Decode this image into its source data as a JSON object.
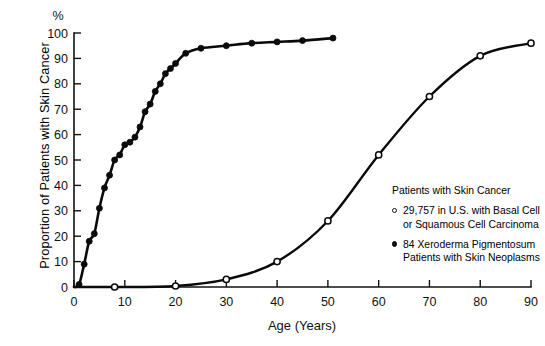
{
  "chart_data": {
    "type": "line",
    "title": "",
    "xlabel": "Age (Years)",
    "ylabel": "Proportion of Patients with Skin Cancer",
    "unit_label": "%",
    "xlim": [
      0,
      90
    ],
    "ylim": [
      0,
      100
    ],
    "xticks": [
      0,
      10,
      20,
      30,
      40,
      50,
      60,
      70,
      80,
      90
    ],
    "xtick_labels": [
      "0",
      "10",
      "20",
      "30",
      "40",
      "50",
      "60",
      "70",
      "80",
      "90"
    ],
    "yticks": [
      0,
      10,
      20,
      30,
      40,
      50,
      60,
      70,
      80,
      90,
      100
    ],
    "ytick_labels": [
      "0",
      "10",
      "20",
      "30",
      "40",
      "50",
      "60",
      "70",
      "80",
      "90",
      "100"
    ],
    "grid": false,
    "legend_position": "center-right",
    "legend_title": "Patients with Skin Cancer",
    "series": [
      {
        "name": "29,757 in U.S. with Basal Cell or Squamous Cell Carcinoma",
        "marker": "open-circle",
        "points": [
          {
            "x": 8,
            "y": 0
          },
          {
            "x": 20,
            "y": 0.4
          },
          {
            "x": 30,
            "y": 3
          },
          {
            "x": 40,
            "y": 10
          },
          {
            "x": 50,
            "y": 26
          },
          {
            "x": 60,
            "y": 52
          },
          {
            "x": 70,
            "y": 75
          },
          {
            "x": 80,
            "y": 91
          },
          {
            "x": 90,
            "y": 96
          }
        ]
      },
      {
        "name": "84 Xeroderma Pigmentosum Patients with Skin Neoplasms",
        "marker": "filled-circle",
        "points": [
          {
            "x": 1,
            "y": 1
          },
          {
            "x": 2,
            "y": 9
          },
          {
            "x": 3,
            "y": 18
          },
          {
            "x": 4,
            "y": 21
          },
          {
            "x": 5,
            "y": 31
          },
          {
            "x": 6,
            "y": 39
          },
          {
            "x": 7,
            "y": 44
          },
          {
            "x": 8,
            "y": 50
          },
          {
            "x": 9,
            "y": 52
          },
          {
            "x": 10,
            "y": 56
          },
          {
            "x": 11,
            "y": 57
          },
          {
            "x": 12,
            "y": 59
          },
          {
            "x": 13,
            "y": 63
          },
          {
            "x": 14,
            "y": 69
          },
          {
            "x": 15,
            "y": 72
          },
          {
            "x": 16,
            "y": 77
          },
          {
            "x": 17,
            "y": 80
          },
          {
            "x": 18,
            "y": 84
          },
          {
            "x": 19,
            "y": 86
          },
          {
            "x": 20,
            "y": 88
          },
          {
            "x": 22,
            "y": 92
          },
          {
            "x": 25,
            "y": 94
          },
          {
            "x": 30,
            "y": 95
          },
          {
            "x": 35,
            "y": 96
          },
          {
            "x": 40,
            "y": 96.5
          },
          {
            "x": 45,
            "y": 97
          },
          {
            "x": 51,
            "y": 98
          }
        ]
      }
    ]
  },
  "legend": {
    "title": "Patients with Skin Cancer",
    "entries": [
      {
        "marker": "open-circle",
        "line1": "29,757 in U.S. with Basal Cell",
        "line2": "or Squamous Cell Carcinoma"
      },
      {
        "marker": "filled-circle",
        "line1": "84 Xeroderma Pigmentosum",
        "line2": "Patients with Skin Neoplasms"
      }
    ]
  },
  "axes": {
    "unit_label": "%",
    "x_title": "Age (Years)",
    "y_title": "Proportion of Patients with Skin Cancer"
  }
}
